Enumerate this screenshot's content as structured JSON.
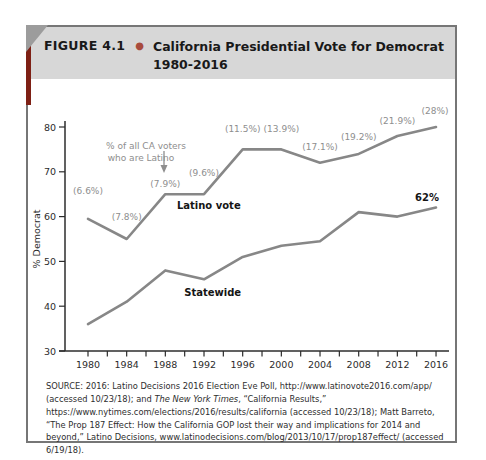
{
  "figure": {
    "label": "FIGURE 4.1",
    "bullet_icon": "●",
    "title_line1": "California Presidential Vote for Democrat",
    "title_line2": "1980-2016"
  },
  "colors": {
    "accent_red": "#7e2015",
    "bullet_red": "#a84b3d",
    "header_bg": "#d7d7d7",
    "corner_gray": "#9c9c9c",
    "line_gray": "#878787",
    "annotation_gray": "#8e8e8e",
    "border_gray": "#767676"
  },
  "chart_data": {
    "type": "line",
    "title": "California Presidential Vote for Democrat 1980-2016",
    "xlabel": "",
    "ylabel": "% Democrat",
    "grid": false,
    "x": [
      1980,
      1984,
      1988,
      1992,
      1996,
      2000,
      2004,
      2008,
      2012,
      2016
    ],
    "x_tick_labels": [
      "1980",
      "1984",
      "1988",
      "1992",
      "1996",
      "2000",
      "2004",
      "2008",
      "2012",
      "2016"
    ],
    "ylim": [
      30,
      80
    ],
    "yticks": [
      30,
      40,
      50,
      60,
      70,
      80
    ],
    "series": [
      {
        "name": "Latino vote",
        "values": [
          59.5,
          55,
          65,
          65,
          75,
          75,
          72,
          74,
          78,
          80
        ],
        "label_at": [
          1992.5,
          61.7
        ]
      },
      {
        "name": "Statewide",
        "values": [
          36,
          41,
          48,
          46,
          51,
          53.5,
          54.5,
          61,
          60,
          62
        ],
        "label_at": [
          1992.9,
          42.2
        ]
      }
    ],
    "point_annotations": [
      {
        "label": "(6.6%)",
        "dx": 0,
        "dy": -25
      },
      {
        "label": "(7.8%)",
        "dx": 0,
        "dy": -19
      },
      {
        "label": "(7.9%)",
        "dx": 0,
        "dy": -7
      },
      {
        "label": "(9.6%)",
        "dx": 0,
        "dy": -18
      },
      {
        "label": "(11.5%)",
        "dx": 0,
        "dy": -17
      },
      {
        "label": "(13.9%)",
        "dx": 0,
        "dy": -17
      },
      {
        "label": "(17.1%)",
        "dx": 0,
        "dy": -13
      },
      {
        "label": "(19.2%)",
        "dx": 0,
        "dy": -14
      },
      {
        "label": "(21.9%)",
        "dx": 0,
        "dy": -12
      },
      {
        "label": "(28%)",
        "dx": -1,
        "dy": -13
      }
    ],
    "share_note": {
      "line1": "% of all CA voters",
      "line2": "who are Latino",
      "arrow_icon": "down-arrow"
    },
    "end_label": "62%"
  },
  "source_note": {
    "segments": [
      {
        "text": "SOURCE: 2016: Latino Decisions 2016 Election Eve Poll,  http://www.latinovote2016.com/app/ (accessed 10/23/18); and ",
        "italic": false
      },
      {
        "text": "The New York Times",
        "italic": true
      },
      {
        "text": ", “California Results,” https://www.nytimes.com/elections/2016/results/california (accessed 10/23/18); Matt Barreto, “The Prop 187 Effect: How the California GOP lost their way and implications for 2014 and beyond,” Latino Decisions, www.latinodecisions.com/blog/2013/10/17/prop187effect/ (accessed 6/19/18).",
        "italic": false
      }
    ]
  }
}
